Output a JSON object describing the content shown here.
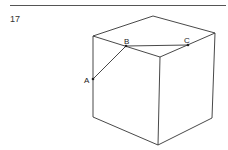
{
  "question": {
    "number": "17"
  },
  "figure": {
    "type": "cube",
    "points": [
      {
        "label": "A",
        "x": 93,
        "y": 79
      },
      {
        "label": "B",
        "x": 126,
        "y": 46
      },
      {
        "label": "C",
        "x": 188,
        "y": 45
      }
    ]
  }
}
